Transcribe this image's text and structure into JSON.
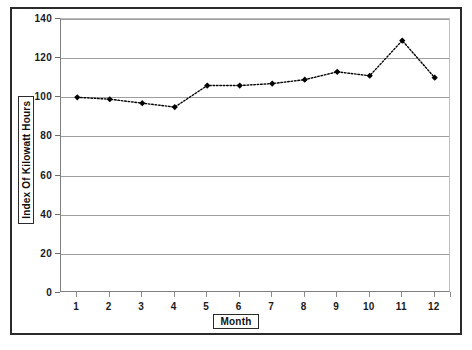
{
  "chart_data": {
    "type": "line",
    "title": "",
    "xlabel": "Month",
    "ylabel": "Index Of Kilowatt Hours",
    "categories": [
      "1",
      "2",
      "3",
      "4",
      "5",
      "6",
      "7",
      "8",
      "9",
      "10",
      "11",
      "12"
    ],
    "x": [
      1,
      2,
      3,
      4,
      5,
      6,
      7,
      8,
      9,
      10,
      11,
      12
    ],
    "values": [
      100,
      99,
      97,
      95,
      106,
      106,
      107,
      109,
      113,
      111,
      129,
      110
    ],
    "series": [
      {
        "name": "Index Of Kilowatt Hours",
        "values": [
          100,
          99,
          97,
          95,
          106,
          106,
          107,
          109,
          113,
          111,
          129,
          110
        ]
      }
    ],
    "ylim": [
      0,
      140
    ],
    "ytick_labels": [
      "0",
      "20",
      "40",
      "60",
      "80",
      "100",
      "120",
      "140"
    ],
    "yticks": [
      0,
      20,
      40,
      60,
      80,
      100,
      120,
      140
    ],
    "xtick_labels": [
      "1",
      "2",
      "3",
      "4",
      "5",
      "6",
      "7",
      "8",
      "9",
      "10",
      "11",
      "12"
    ],
    "grid": "horizontal",
    "legend": "none",
    "line_style": "dotted",
    "marker": "filled-diamond",
    "line_color": "#000000",
    "marker_color": "#000000",
    "gridline_color": "#9e9e9e",
    "plot_background": "#ffffff"
  },
  "axis_titles": {
    "y": "Index Of Kilowatt Hours",
    "x": "Month"
  },
  "bottom_artifact": ""
}
